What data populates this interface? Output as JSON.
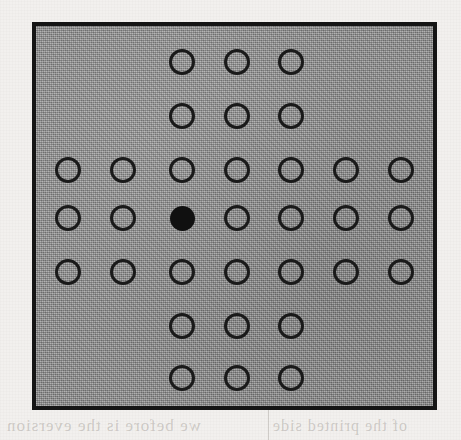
{
  "figure": {
    "panel": {
      "background_color": "#8f8f8f",
      "border_color": "#151515",
      "border_width_px": 4,
      "left": 32,
      "top": 22,
      "width": 405,
      "height": 388
    },
    "grid": {
      "rows": 7,
      "columns": 7,
      "shape": "plus",
      "column_centers_px": [
        32,
        87,
        146,
        201,
        255,
        310,
        365
      ],
      "row_centers_px": [
        36,
        90,
        144,
        192,
        246,
        300,
        352
      ],
      "open_dot_diameter_px": 26,
      "open_dot_stroke_px": 3,
      "filled_dot_diameter_px": 25,
      "open_dot_color": "#1a1a1a",
      "filled_dot_color": "#101010"
    },
    "dots": [
      {
        "row": 1,
        "col": 3,
        "state": "open"
      },
      {
        "row": 1,
        "col": 4,
        "state": "open"
      },
      {
        "row": 1,
        "col": 5,
        "state": "open"
      },
      {
        "row": 2,
        "col": 3,
        "state": "open"
      },
      {
        "row": 2,
        "col": 4,
        "state": "open"
      },
      {
        "row": 2,
        "col": 5,
        "state": "open"
      },
      {
        "row": 3,
        "col": 1,
        "state": "open"
      },
      {
        "row": 3,
        "col": 2,
        "state": "open"
      },
      {
        "row": 3,
        "col": 3,
        "state": "open"
      },
      {
        "row": 3,
        "col": 4,
        "state": "open"
      },
      {
        "row": 3,
        "col": 5,
        "state": "open"
      },
      {
        "row": 3,
        "col": 6,
        "state": "open"
      },
      {
        "row": 3,
        "col": 7,
        "state": "open"
      },
      {
        "row": 4,
        "col": 1,
        "state": "open"
      },
      {
        "row": 4,
        "col": 2,
        "state": "open"
      },
      {
        "row": 4,
        "col": 3,
        "state": "filled"
      },
      {
        "row": 4,
        "col": 4,
        "state": "open"
      },
      {
        "row": 4,
        "col": 5,
        "state": "open"
      },
      {
        "row": 4,
        "col": 6,
        "state": "open"
      },
      {
        "row": 4,
        "col": 7,
        "state": "open"
      },
      {
        "row": 5,
        "col": 1,
        "state": "open"
      },
      {
        "row": 5,
        "col": 2,
        "state": "open"
      },
      {
        "row": 5,
        "col": 3,
        "state": "open"
      },
      {
        "row": 5,
        "col": 4,
        "state": "open"
      },
      {
        "row": 5,
        "col": 5,
        "state": "open"
      },
      {
        "row": 5,
        "col": 6,
        "state": "open"
      },
      {
        "row": 5,
        "col": 7,
        "state": "open"
      },
      {
        "row": 6,
        "col": 3,
        "state": "open"
      },
      {
        "row": 6,
        "col": 4,
        "state": "open"
      },
      {
        "row": 6,
        "col": 5,
        "state": "open"
      },
      {
        "row": 7,
        "col": 3,
        "state": "open"
      },
      {
        "row": 7,
        "col": 4,
        "state": "open"
      },
      {
        "row": 7,
        "col": 5,
        "state": "open"
      }
    ],
    "counts": {
      "total_dots": 33,
      "open_dots": 32,
      "filled_dots": 1
    }
  },
  "page": {
    "background_color": "#f2f0ee",
    "bleed_through": {
      "bottom_left": "we before is the eversion",
      "bottom_right": "of the printed side",
      "right_edge": "pro tion"
    }
  }
}
